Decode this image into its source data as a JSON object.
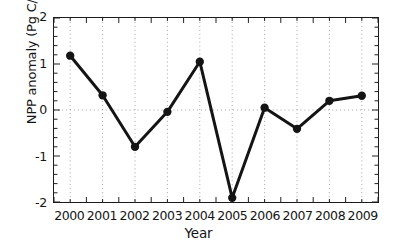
{
  "chart_data": {
    "type": "line",
    "title": "",
    "xlabel": "Year",
    "ylabel": "NPP anomaly (Pg C/y)",
    "x": [
      2000,
      2001,
      2002,
      2003,
      2004,
      2005,
      2006,
      2007,
      2008,
      2009
    ],
    "values": [
      1.18,
      0.32,
      -0.8,
      -0.04,
      1.05,
      -1.91,
      0.05,
      -0.41,
      0.2,
      0.31
    ],
    "series": [
      {
        "name": "NPP anomaly",
        "values": [
          1.18,
          0.32,
          -0.8,
          -0.04,
          1.05,
          -1.91,
          0.05,
          -0.41,
          0.2,
          0.31
        ]
      }
    ],
    "xlim": [
      1999.5,
      2009.5
    ],
    "ylim": [
      -2,
      2
    ],
    "ytick_labels": [
      "2",
      "1",
      "0",
      "-1",
      "-2"
    ],
    "ytick_values": [
      2,
      1,
      0,
      -1,
      -2
    ],
    "xtick_labels": [
      "2000",
      "2001",
      "2002",
      "2003",
      "2004",
      "2005",
      "2006",
      "2007",
      "2008",
      "2009"
    ],
    "grid": "vertical dotted at each year; horizontal dotted at zero",
    "legend": "none",
    "line_color": "#141414",
    "marker": "filled-circle",
    "marker_color": "#141414",
    "grid_color": "#9a9a9a"
  }
}
